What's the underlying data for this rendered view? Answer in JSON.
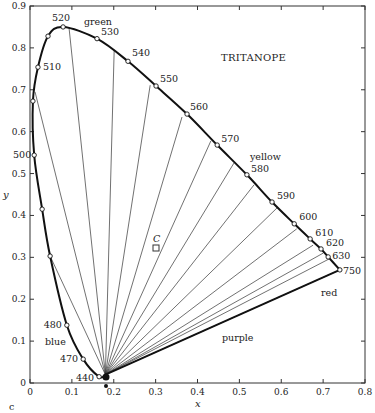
{
  "chart_data": {
    "type": "line",
    "title": "TRITANOPE",
    "xlabel": "x",
    "ylabel": "y",
    "xlim": [
      0,
      0.8
    ],
    "ylim": [
      0,
      0.9
    ],
    "x_ticks": [
      "0",
      "0.1",
      "0.2",
      "0.3",
      "0.4",
      "0.5",
      "0.6",
      "0.7",
      "0.8"
    ],
    "y_ticks": [
      "0",
      "0.1",
      "0.2",
      "0.3",
      "0.4",
      "0.5",
      "0.6",
      "0.7",
      "0.8",
      "0.9"
    ],
    "panel_label": "c",
    "grid": false,
    "region_labels": {
      "green": "green",
      "yellow": "yellow",
      "red": "red",
      "purple": "purple",
      "blue": "blue"
    },
    "white_point": {
      "label": "C",
      "x": 0.3,
      "y": 0.32
    },
    "copunctal_point": {
      "x": 0.18,
      "y": 0.02
    },
    "spectrum_locus_labels": [
      {
        "nm": "440",
        "x": 0.165,
        "y": 0.015
      },
      {
        "nm": "470",
        "x": 0.127,
        "y": 0.057
      },
      {
        "nm": "480",
        "x": 0.088,
        "y": 0.138
      },
      {
        "nm": "500",
        "x": 0.01,
        "y": 0.544
      },
      {
        "nm": "510",
        "x": 0.019,
        "y": 0.754
      },
      {
        "nm": "520",
        "x": 0.079,
        "y": 0.85
      },
      {
        "nm": "530",
        "x": 0.16,
        "y": 0.822
      },
      {
        "nm": "540",
        "x": 0.234,
        "y": 0.768
      },
      {
        "nm": "550",
        "x": 0.301,
        "y": 0.709
      },
      {
        "nm": "560",
        "x": 0.375,
        "y": 0.642
      },
      {
        "nm": "570",
        "x": 0.447,
        "y": 0.568
      },
      {
        "nm": "580",
        "x": 0.518,
        "y": 0.497
      },
      {
        "nm": "590",
        "x": 0.578,
        "y": 0.432
      },
      {
        "nm": "600",
        "x": 0.631,
        "y": 0.38
      },
      {
        "nm": "610",
        "x": 0.669,
        "y": 0.344
      },
      {
        "nm": "620",
        "x": 0.695,
        "y": 0.32
      },
      {
        "nm": "630",
        "x": 0.712,
        "y": 0.301
      },
      {
        "nm": "750",
        "x": 0.74,
        "y": 0.27
      }
    ],
    "extra_locus_markers": [
      {
        "x": 0.043,
        "y": 0.828
      },
      {
        "x": 0.007,
        "y": 0.673
      },
      {
        "x": 0.029,
        "y": 0.415
      },
      {
        "x": 0.048,
        "y": 0.303
      }
    ],
    "confusion_line_endpoints": [
      {
        "x": 0.012,
        "y": 0.695
      },
      {
        "x": 0.093,
        "y": 0.85
      },
      {
        "x": 0.201,
        "y": 0.793
      },
      {
        "x": 0.287,
        "y": 0.711
      },
      {
        "x": 0.363,
        "y": 0.635
      },
      {
        "x": 0.432,
        "y": 0.578
      },
      {
        "x": 0.487,
        "y": 0.525
      },
      {
        "x": 0.535,
        "y": 0.473
      },
      {
        "x": 0.59,
        "y": 0.418
      },
      {
        "x": 0.637,
        "y": 0.368
      },
      {
        "x": 0.676,
        "y": 0.329
      },
      {
        "x": 0.7,
        "y": 0.31
      },
      {
        "x": 0.714,
        "y": 0.296
      },
      {
        "x": 0.74,
        "y": 0.27
      },
      {
        "x": 0.048,
        "y": 0.303
      }
    ],
    "series": [
      {
        "name": "spectrum locus",
        "style": "thick-line"
      },
      {
        "name": "purple line",
        "from_nm": "380",
        "to_nm": "750",
        "style": "thick-line"
      },
      {
        "name": "tritanopic confusion lines",
        "style": "thin-lines"
      }
    ]
  }
}
